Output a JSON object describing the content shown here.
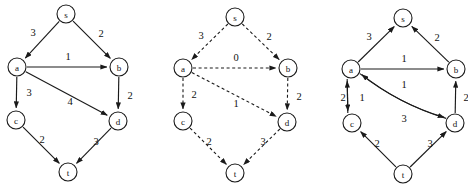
{
  "figure": {
    "background_color": "#ffffff",
    "stroke_color": "#1a1a1a",
    "width": 468,
    "height": 193
  },
  "graphs": [
    {
      "id": "graph-1",
      "name": "original-graph",
      "edge_style": "solid",
      "origin_x": 0,
      "nodes": [
        {
          "id": "s",
          "label": "s",
          "x": 66,
          "y": 14,
          "r": 9
        },
        {
          "id": "a",
          "label": "a",
          "x": 17,
          "y": 67,
          "r": 9
        },
        {
          "id": "b",
          "label": "b",
          "x": 119,
          "y": 67,
          "r": 9
        },
        {
          "id": "c",
          "label": "c",
          "x": 16,
          "y": 120,
          "r": 9
        },
        {
          "id": "d",
          "label": "d",
          "x": 118,
          "y": 121,
          "r": 9
        },
        {
          "id": "t",
          "label": "t",
          "x": 68,
          "y": 172,
          "r": 9
        }
      ],
      "edges": [
        {
          "from": "s",
          "to": "a",
          "weight": "3",
          "label_x": 33,
          "label_y": 32,
          "curve": 0
        },
        {
          "from": "s",
          "to": "b",
          "weight": "2",
          "label_x": 101,
          "label_y": 33,
          "curve": 0
        },
        {
          "from": "a",
          "to": "b",
          "weight": "1",
          "label_x": 68,
          "label_y": 56,
          "curve": 0
        },
        {
          "from": "a",
          "to": "c",
          "weight": "3",
          "label_x": 29,
          "label_y": 92,
          "curve": 0
        },
        {
          "from": "a",
          "to": "d",
          "weight": "4",
          "label_x": 70,
          "label_y": 101,
          "curve": 0
        },
        {
          "from": "b",
          "to": "d",
          "weight": "2",
          "label_x": 130,
          "label_y": 95,
          "curve": 0
        },
        {
          "from": "c",
          "to": "t",
          "weight": "2",
          "label_x": 42,
          "label_y": 139,
          "curve": 0
        },
        {
          "from": "d",
          "to": "t",
          "weight": "3",
          "label_x": 96,
          "label_y": 141,
          "curve": 0
        }
      ]
    },
    {
      "id": "graph-2",
      "name": "dashed-graph",
      "edge_style": "dashed",
      "origin_x": 167,
      "nodes": [
        {
          "id": "s",
          "label": "s",
          "x": 235,
          "y": 17,
          "r": 9
        },
        {
          "id": "a",
          "label": "a",
          "x": 183,
          "y": 68,
          "r": 9
        },
        {
          "id": "b",
          "label": "b",
          "x": 288,
          "y": 68,
          "r": 9
        },
        {
          "id": "c",
          "label": "c",
          "x": 183,
          "y": 121,
          "r": 9
        },
        {
          "id": "d",
          "label": "d",
          "x": 287,
          "y": 122,
          "r": 9
        },
        {
          "id": "t",
          "label": "t",
          "x": 235,
          "y": 173,
          "r": 9
        }
      ],
      "edges": [
        {
          "from": "s",
          "to": "a",
          "weight": "3",
          "label_x": 201,
          "label_y": 35,
          "curve": 0
        },
        {
          "from": "s",
          "to": "b",
          "weight": "2",
          "label_x": 269,
          "label_y": 36,
          "curve": 0
        },
        {
          "from": "a",
          "to": "b",
          "weight": "0",
          "label_x": 236,
          "label_y": 57,
          "curve": 0
        },
        {
          "from": "a",
          "to": "c",
          "weight": "2",
          "label_x": 194,
          "label_y": 94,
          "curve": 0
        },
        {
          "from": "a",
          "to": "d",
          "weight": "1",
          "label_x": 236,
          "label_y": 103,
          "curve": 0
        },
        {
          "from": "b",
          "to": "d",
          "weight": "2",
          "label_x": 299,
          "label_y": 96,
          "curve": 0
        },
        {
          "from": "c",
          "to": "t",
          "weight": "2",
          "label_x": 209,
          "label_y": 141,
          "curve": 0
        },
        {
          "from": "d",
          "to": "t",
          "weight": "3",
          "label_x": 263,
          "label_y": 141,
          "curve": 0
        }
      ]
    },
    {
      "id": "graph-3",
      "name": "residual-reversed-graph",
      "edge_style": "solid",
      "origin_x": 335,
      "nodes": [
        {
          "id": "s",
          "label": "s",
          "x": 403,
          "y": 18,
          "r": 9
        },
        {
          "id": "a",
          "label": "a",
          "x": 351,
          "y": 69,
          "r": 9
        },
        {
          "id": "b",
          "label": "b",
          "x": 456,
          "y": 69,
          "r": 9
        },
        {
          "id": "c",
          "label": "c",
          "x": 352,
          "y": 123,
          "r": 9
        },
        {
          "id": "d",
          "label": "d",
          "x": 455,
          "y": 123,
          "r": 9
        },
        {
          "id": "t",
          "label": "t",
          "x": 403,
          "y": 174,
          "r": 9
        }
      ],
      "edges": [
        {
          "from": "a",
          "to": "s",
          "weight": "3",
          "label_x": 369,
          "label_y": 36,
          "curve": 0
        },
        {
          "from": "b",
          "to": "s",
          "weight": "2",
          "label_x": 437,
          "label_y": 37,
          "curve": 0
        },
        {
          "from": "a",
          "to": "b",
          "weight": "1",
          "label_x": 404,
          "label_y": 58,
          "curve": 0
        },
        {
          "from": "c",
          "to": "a",
          "weight": "2",
          "label_x": 343,
          "label_y": 97,
          "curve": 0,
          "offset": -4
        },
        {
          "from": "a",
          "to": "c",
          "weight": "1",
          "label_x": 362,
          "label_y": 97,
          "curve": 0,
          "offset": 4
        },
        {
          "from": "d",
          "to": "a",
          "weight": "1",
          "label_x": 404,
          "label_y": 84,
          "curve": -9
        },
        {
          "from": "a",
          "to": "d",
          "weight": "3",
          "label_x": 404,
          "label_y": 118,
          "curve": 9
        },
        {
          "from": "d",
          "to": "b",
          "weight": "2",
          "label_x": 466,
          "label_y": 97,
          "curve": 0
        },
        {
          "from": "t",
          "to": "c",
          "weight": "2",
          "label_x": 377,
          "label_y": 143,
          "curve": 0
        },
        {
          "from": "t",
          "to": "d",
          "weight": "3",
          "label_x": 430,
          "label_y": 143,
          "curve": 0
        }
      ]
    }
  ]
}
